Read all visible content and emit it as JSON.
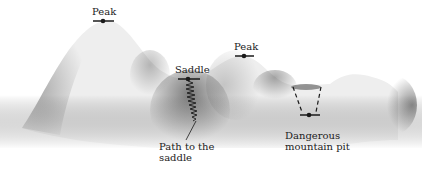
{
  "diagram": {
    "title": "",
    "labels": {
      "peak_1": "Peak",
      "peak_2": "Peak",
      "saddle": "Saddle",
      "path_line1": "Path to the",
      "path_line2": "saddle",
      "pit_line1": "Dangerous",
      "pit_line2": "mountain pit"
    },
    "markers": [
      {
        "name": "peak-1",
        "x": 103,
        "y": 21
      },
      {
        "name": "saddle",
        "x": 188,
        "y": 79
      },
      {
        "name": "peak-2",
        "x": 244,
        "y": 56
      },
      {
        "name": "pit",
        "x": 309,
        "y": 115
      }
    ],
    "colors": {
      "background": "#ffffff",
      "terrain_light": "#f6f6f6",
      "terrain_shadow": "#6a6a6a",
      "ink": "#1a1a1a"
    }
  }
}
